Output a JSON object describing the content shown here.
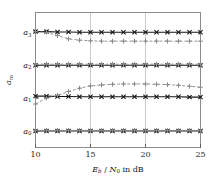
{
  "chart_data": {
    "type": "line",
    "title": "",
    "subtitle": "",
    "xlabel": "E_b / N_0 in dB",
    "xlabel_parts": {
      "E": "E",
      "b": "b",
      "slash": " / ",
      "N": "N",
      "zero": "0",
      "tail": " in dB"
    },
    "ylabel": "a_m",
    "ylabel_parts": {
      "a": "a",
      "m": "m"
    },
    "xlim": [
      10,
      25
    ],
    "ylim": [
      -0.5,
      3.6
    ],
    "xticks": [
      10,
      15,
      20,
      25
    ],
    "xticklabels": [
      "10",
      "15",
      "20",
      "25"
    ],
    "yticks": [
      0,
      1,
      2,
      3
    ],
    "yticklabels": [
      "a_0",
      "a_1",
      "a_2",
      "a_3"
    ],
    "ytick_parts": [
      {
        "base": "a",
        "sub": "0"
      },
      {
        "base": "a",
        "sub": "1"
      },
      {
        "base": "a",
        "sub": "2"
      },
      {
        "base": "a",
        "sub": "3"
      }
    ],
    "grid": "vertical",
    "grid_color": "#b4b4b4",
    "frame_color": "#8c8c8c",
    "legend": "none",
    "legend_position": "none",
    "x": [
      10,
      11,
      12,
      13,
      14,
      15,
      16,
      17,
      18,
      19,
      20,
      21,
      22,
      23,
      24,
      25
    ],
    "series": [
      {
        "name": "solid-cross-a3",
        "group": "a3",
        "marker": "x",
        "linestyle": "solid",
        "color": "#141414",
        "values": [
          3.02,
          3.02,
          3.01,
          3.01,
          3.0,
          3.0,
          3.0,
          3.0,
          3.0,
          3.0,
          3.0,
          3.0,
          3.0,
          3.0,
          3.0,
          3.0
        ]
      },
      {
        "name": "dashed-plus-a3",
        "group": "a3",
        "marker": "+",
        "linestyle": "dashed",
        "color": "#8a8a8a",
        "values": [
          3.02,
          3.0,
          2.9,
          2.8,
          2.76,
          2.74,
          2.73,
          2.73,
          2.73,
          2.73,
          2.73,
          2.73,
          2.73,
          2.73,
          2.73,
          2.73
        ]
      },
      {
        "name": "solid-cross-a2",
        "group": "a2",
        "marker": "x",
        "linestyle": "solid",
        "color": "#141414",
        "values": [
          2.0,
          2.0,
          2.0,
          2.0,
          2.0,
          2.0,
          2.0,
          2.0,
          2.0,
          2.0,
          2.0,
          2.0,
          2.0,
          2.0,
          2.0,
          2.0
        ]
      },
      {
        "name": "dashed-plus-a2",
        "group": "a2",
        "marker": "+",
        "linestyle": "dashed",
        "color": "#8a8a8a",
        "values": [
          2.03,
          2.03,
          2.03,
          2.03,
          2.03,
          2.03,
          2.03,
          2.03,
          2.03,
          2.03,
          2.03,
          2.03,
          2.03,
          2.03,
          2.03,
          2.03
        ]
      },
      {
        "name": "solid-cross-a1",
        "group": "a1",
        "marker": "x",
        "linestyle": "solid",
        "color": "#141414",
        "values": [
          1.06,
          1.06,
          1.05,
          1.05,
          1.04,
          1.04,
          1.04,
          1.04,
          1.04,
          1.04,
          1.04,
          1.04,
          1.04,
          1.04,
          1.03,
          1.03
        ]
      },
      {
        "name": "dashed-plus-a1",
        "group": "a1",
        "marker": "+",
        "linestyle": "dashed",
        "color": "#8a8a8a",
        "values": [
          0.82,
          1.0,
          1.08,
          1.2,
          1.3,
          1.37,
          1.4,
          1.42,
          1.43,
          1.43,
          1.43,
          1.42,
          1.41,
          1.39,
          1.36,
          1.33
        ]
      },
      {
        "name": "solid-cross-a0",
        "group": "a0",
        "marker": "x",
        "linestyle": "solid",
        "color": "#141414",
        "values": [
          0.0,
          0.0,
          0.0,
          0.0,
          0.0,
          0.0,
          0.0,
          0.0,
          0.0,
          0.0,
          0.0,
          0.0,
          0.0,
          0.0,
          0.0,
          0.0
        ]
      },
      {
        "name": "dashed-plus-a0",
        "group": "a0",
        "marker": "+",
        "linestyle": "dashed",
        "color": "#8a8a8a",
        "values": [
          0.02,
          0.02,
          0.02,
          0.02,
          0.02,
          0.02,
          0.02,
          0.02,
          0.02,
          0.02,
          0.02,
          0.02,
          0.02,
          0.02,
          0.02,
          0.02
        ]
      }
    ]
  }
}
